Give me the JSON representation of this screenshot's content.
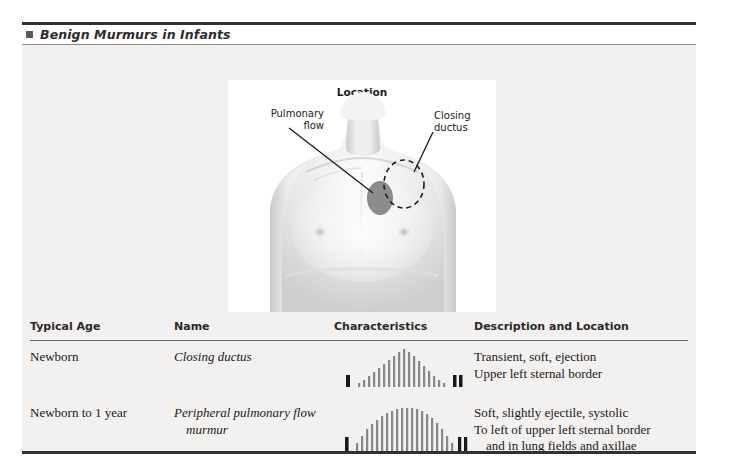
{
  "title": {
    "text": "Benign Murmurs in Infants",
    "bullet_icon": "square-bullet-icon"
  },
  "figure": {
    "title": "Location",
    "label_left": "Pulmonary\nflow",
    "label_right": "Closing\nductus",
    "marker_filled_name": "pulmonary-flow-marker",
    "marker_dashed_name": "closing-ductus-marker"
  },
  "table": {
    "headers": [
      "Typical Age",
      "Name",
      "Characteristics",
      "Description and Location"
    ],
    "rows": [
      {
        "age": "Newborn",
        "name": "Closing ductus",
        "name_cont": "",
        "description": [
          "Transient, soft, ejection",
          "Upper left sternal border"
        ],
        "description_indent": "",
        "characteristics_shape": "crescendo-decrescendo-diamond",
        "sound_first": "",
        "sound_second": ""
      },
      {
        "age": "Newborn to 1 year",
        "name": "Peripheral pulmonary flow",
        "name_cont": "murmur",
        "description": [
          "Soft, slightly ejectile, systolic",
          "To left of upper left sternal border"
        ],
        "description_indent": "and in lung fields and axillae",
        "characteristics_shape": "plateau-ejection",
        "sound_first": "I",
        "sound_second": "II"
      }
    ]
  },
  "colors": {
    "rule_dark": "#33302f",
    "rule_light": "#8d8a88",
    "panel_bg": "#f2f1ef",
    "figure_bg": "#ffffff",
    "text": "#1a1817",
    "marker_fill": "#8e8c8b",
    "murmur_bar": "#8a8886",
    "sound_bar": "#1a1817"
  }
}
